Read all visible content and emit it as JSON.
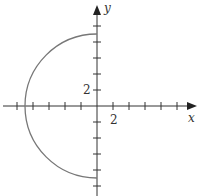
{
  "diagram": {
    "type": "coordinate-plot",
    "curve": "left semicircle",
    "equation_hint": "x = -sqrt(81 - y^2)",
    "radius": 9,
    "center": [
      0,
      0
    ],
    "axes": {
      "x_label": "x",
      "y_label": "y",
      "tick_spacing": 2,
      "x_tick_label": "2",
      "y_tick_label": "2",
      "x_range": [
        -12,
        12
      ],
      "y_range": [
        -10,
        11
      ]
    },
    "colors": {
      "axis": "#333333",
      "curve": "#777777"
    }
  }
}
